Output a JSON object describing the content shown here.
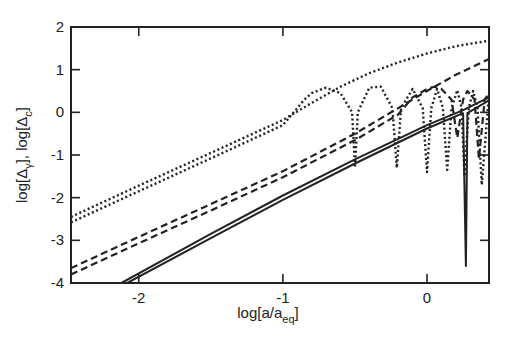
{
  "chart_data": {
    "type": "line",
    "title": "",
    "xlabel": "log[a/a_eq]",
    "ylabel": "log[Δγ], log[Δc]",
    "xlabel_parts": {
      "main": "log[a/a",
      "sub": "eq",
      "end": "]"
    },
    "ylabel_parts": {
      "p1": "log[Δ",
      "sub1": "γ",
      "p2": "], log[Δ",
      "sub2": "c",
      "p3": "]"
    },
    "xlim": [
      -2.47,
      0.43
    ],
    "ylim": [
      -4,
      2
    ],
    "xticks": [
      -2,
      -1,
      0
    ],
    "yticks": [
      -4,
      -3,
      -2,
      -1,
      0,
      1,
      2
    ],
    "xtick_labels": [
      "-2",
      "-1",
      "0"
    ],
    "ytick_labels": [
      "-4",
      "-3",
      "-2",
      "-1",
      "0",
      "1",
      "2"
    ],
    "grid": false,
    "legend": null,
    "series": [
      {
        "name": "dotted-upper (smooth)",
        "style": "dotted",
        "x": [
          -2.47,
          -2.0,
          -1.5,
          -1.0,
          -0.8,
          -0.6,
          -0.4,
          -0.2,
          0.0,
          0.2,
          0.43
        ],
        "y": [
          -2.45,
          -1.72,
          -0.95,
          -0.18,
          0.22,
          0.6,
          0.92,
          1.17,
          1.38,
          1.55,
          1.68
        ]
      },
      {
        "name": "dotted-lower (oscillating)",
        "style": "dotted",
        "x": [
          -2.47,
          -2.0,
          -1.5,
          -1.0,
          -0.85,
          -0.8,
          -0.7,
          -0.6,
          -0.52,
          -0.5,
          -0.48,
          -0.4,
          -0.32,
          -0.24,
          -0.21,
          -0.18,
          -0.1,
          -0.03,
          0.0,
          0.03,
          0.07,
          0.11,
          0.14,
          0.17,
          0.21,
          0.24,
          0.26,
          0.29,
          0.32,
          0.35,
          0.38,
          0.43
        ],
        "y": [
          -2.58,
          -1.85,
          -1.08,
          -0.3,
          0.3,
          0.45,
          0.58,
          0.45,
          0.0,
          -1.3,
          0.0,
          0.58,
          0.6,
          0.1,
          -1.3,
          0.1,
          0.55,
          0.1,
          -1.4,
          0.1,
          0.55,
          0.1,
          -1.35,
          0.1,
          0.52,
          0.1,
          -1.5,
          0.1,
          0.5,
          0.1,
          -1.7,
          0.45
        ]
      },
      {
        "name": "dashed-upper (smooth)",
        "style": "dashed",
        "x": [
          -2.47,
          -2.0,
          -1.5,
          -1.0,
          -0.5,
          -0.2,
          0.0,
          0.2,
          0.43
        ],
        "y": [
          -3.65,
          -2.92,
          -2.15,
          -1.38,
          -0.5,
          0.1,
          0.5,
          0.88,
          1.25
        ]
      },
      {
        "name": "dashed-lower (oscillating)",
        "style": "dashed",
        "x": [
          -2.47,
          -2.0,
          -1.5,
          -1.0,
          -0.5,
          -0.2,
          -0.1,
          0.0,
          0.05,
          0.1,
          0.17,
          0.21,
          0.25,
          0.28,
          0.33,
          0.36,
          0.4,
          0.43
        ],
        "y": [
          -3.8,
          -3.07,
          -2.3,
          -1.52,
          -0.65,
          -0.05,
          0.35,
          0.55,
          0.6,
          0.55,
          0.3,
          -0.6,
          0.3,
          0.5,
          0.3,
          -1.1,
          0.3,
          0.45
        ]
      },
      {
        "name": "solid-upper",
        "style": "solid",
        "x": [
          -2.12,
          -1.5,
          -1.0,
          -0.5,
          0.0,
          0.25,
          0.43
        ],
        "y": [
          -4.0,
          -2.85,
          -1.95,
          -1.1,
          -0.3,
          0.05,
          0.35
        ]
      },
      {
        "name": "solid-lower",
        "style": "solid",
        "x": [
          -2.08,
          -1.5,
          -1.0,
          -0.5,
          0.0,
          0.25,
          0.27,
          0.28,
          0.43
        ],
        "y": [
          -4.0,
          -2.95,
          -2.05,
          -1.2,
          -0.38,
          -0.02,
          -3.6,
          -0.02,
          0.28
        ]
      }
    ]
  }
}
